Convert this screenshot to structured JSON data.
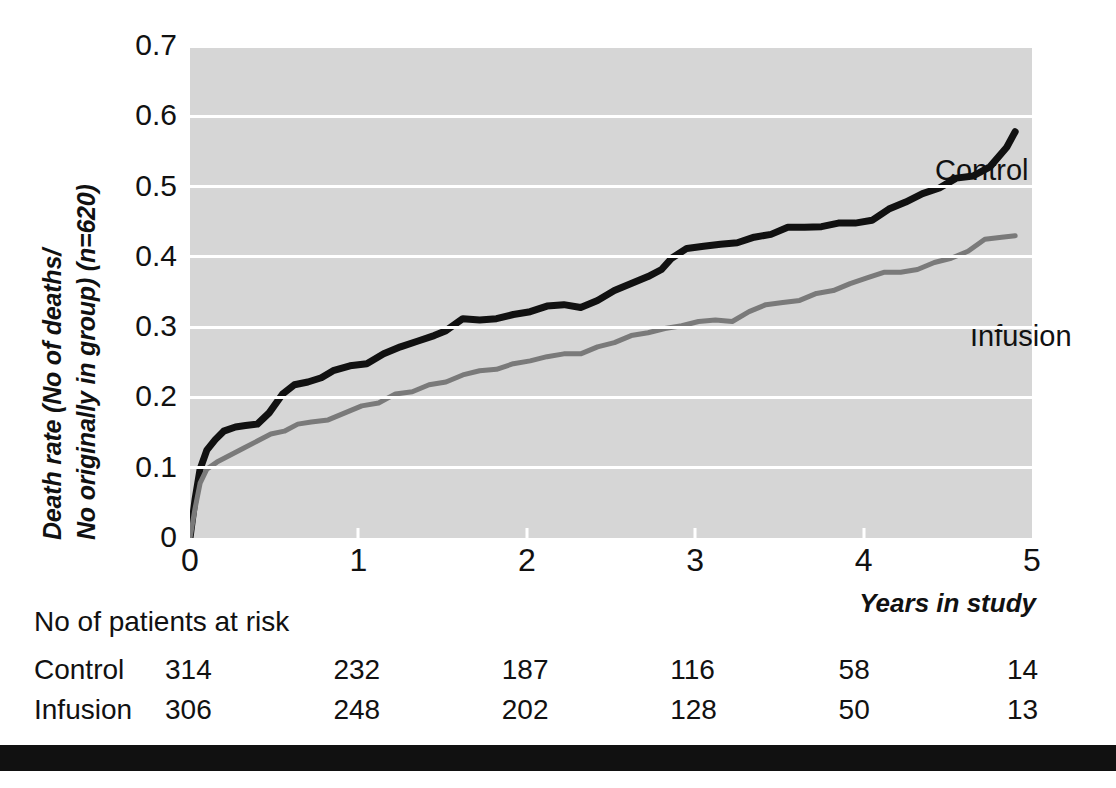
{
  "axes": {
    "ytitle_line1": "Death rate (No of deaths/",
    "ytitle_line2": "No originally in group) (n=620)",
    "xtitle": "Years in study",
    "yticks": [
      "0.7",
      "0.6",
      "0.5",
      "0.4",
      "0.3",
      "0.2",
      "0.1",
      "0"
    ],
    "xticks": [
      "0",
      "1",
      "2",
      "3",
      "4",
      "5"
    ]
  },
  "series_labels": {
    "control": "Control",
    "infusion": "Infusion"
  },
  "risk_table": {
    "title": "No of patients at risk",
    "rows": [
      {
        "name": "Control",
        "values": [
          "314",
          "232",
          "187",
          "116",
          "58",
          "14"
        ]
      },
      {
        "name": "Infusion",
        "values": [
          "306",
          "248",
          "202",
          "128",
          "50",
          "13"
        ]
      }
    ]
  },
  "colors": {
    "plot_background": "#d6d6d6",
    "gridline": "#ffffff",
    "control_line": "#111111",
    "infusion_line": "#7a7a7a",
    "text": "#111111",
    "bottom_bar": "#111111"
  },
  "chart_data": {
    "type": "line",
    "title": "",
    "subtitle": "",
    "xlabel": "Years in study",
    "ylabel": "Death rate (No of deaths/No originally in group) (n=620)",
    "xlim": [
      0,
      5
    ],
    "ylim": [
      0,
      0.7
    ],
    "xticks": [
      0,
      1,
      2,
      3,
      4,
      5
    ],
    "yticks": [
      0,
      0.1,
      0.2,
      0.3,
      0.4,
      0.5,
      0.6,
      0.7
    ],
    "grid": "horizontal",
    "legend_position": "inline-annotation",
    "n_total": 620,
    "step_style": "kaplan-meier staircase",
    "series": [
      {
        "name": "Control",
        "color": "#111111",
        "line_width": 7,
        "x": [
          0.0,
          0.03,
          0.06,
          0.1,
          0.15,
          0.2,
          0.27,
          0.33,
          0.4,
          0.47,
          0.55,
          0.62,
          0.7,
          0.78,
          0.85,
          0.95,
          1.05,
          1.15,
          1.25,
          1.35,
          1.45,
          1.52,
          1.62,
          1.72,
          1.82,
          1.92,
          2.02,
          2.12,
          2.22,
          2.32,
          2.42,
          2.52,
          2.62,
          2.72,
          2.8,
          2.86,
          2.95,
          3.05,
          3.15,
          3.25,
          3.35,
          3.45,
          3.55,
          3.65,
          3.75,
          3.85,
          3.95,
          4.05,
          4.15,
          4.25,
          4.35,
          4.45,
          4.55,
          4.65,
          4.75,
          4.85,
          4.9
        ],
        "y": [
          0.0,
          0.055,
          0.098,
          0.125,
          0.14,
          0.152,
          0.158,
          0.16,
          0.162,
          0.178,
          0.205,
          0.218,
          0.222,
          0.228,
          0.238,
          0.245,
          0.248,
          0.262,
          0.272,
          0.28,
          0.288,
          0.295,
          0.312,
          0.31,
          0.312,
          0.318,
          0.322,
          0.33,
          0.332,
          0.328,
          0.338,
          0.352,
          0.362,
          0.372,
          0.382,
          0.398,
          0.412,
          0.415,
          0.418,
          0.42,
          0.428,
          0.432,
          0.442,
          0.442,
          0.443,
          0.448,
          0.448,
          0.452,
          0.468,
          0.478,
          0.49,
          0.498,
          0.512,
          0.515,
          0.528,
          0.556,
          0.578
        ]
      },
      {
        "name": "Infusion",
        "color": "#7a7a7a",
        "line_width": 5,
        "x": [
          0.0,
          0.03,
          0.06,
          0.1,
          0.16,
          0.24,
          0.32,
          0.4,
          0.48,
          0.56,
          0.64,
          0.72,
          0.82,
          0.92,
          1.02,
          1.12,
          1.22,
          1.32,
          1.42,
          1.52,
          1.62,
          1.72,
          1.82,
          1.92,
          2.02,
          2.12,
          2.22,
          2.32,
          2.42,
          2.52,
          2.62,
          2.72,
          2.82,
          2.92,
          3.02,
          3.12,
          3.22,
          3.32,
          3.42,
          3.52,
          3.62,
          3.72,
          3.82,
          3.92,
          4.02,
          4.12,
          4.22,
          4.32,
          4.42,
          4.52,
          4.62,
          4.72,
          4.82,
          4.9
        ],
        "y": [
          0.0,
          0.042,
          0.078,
          0.098,
          0.108,
          0.118,
          0.128,
          0.138,
          0.148,
          0.152,
          0.162,
          0.165,
          0.168,
          0.178,
          0.188,
          0.192,
          0.205,
          0.208,
          0.218,
          0.222,
          0.232,
          0.238,
          0.24,
          0.248,
          0.252,
          0.258,
          0.262,
          0.262,
          0.272,
          0.278,
          0.288,
          0.292,
          0.298,
          0.302,
          0.308,
          0.31,
          0.308,
          0.322,
          0.332,
          0.335,
          0.338,
          0.348,
          0.352,
          0.362,
          0.37,
          0.378,
          0.378,
          0.382,
          0.392,
          0.398,
          0.408,
          0.425,
          0.428,
          0.43
        ]
      }
    ],
    "annotations": [
      {
        "text": "Control",
        "x": 4.1,
        "y": 0.61
      },
      {
        "text": "Infusion",
        "x": 4.3,
        "y": 0.385
      }
    ],
    "risk_table": {
      "title": "No of patients at risk",
      "times": [
        0,
        1,
        2,
        3,
        4,
        5
      ],
      "rows": [
        {
          "name": "Control",
          "values": [
            314,
            232,
            187,
            116,
            58,
            14
          ]
        },
        {
          "name": "Infusion",
          "values": [
            306,
            248,
            202,
            128,
            50,
            13
          ]
        }
      ]
    }
  }
}
